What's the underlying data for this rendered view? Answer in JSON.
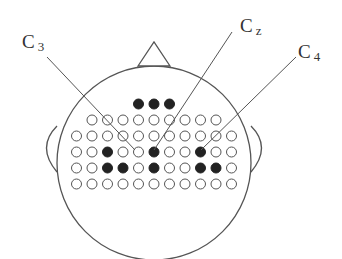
{
  "colors": {
    "stroke": "#555555",
    "filled": "#222222",
    "empty": "#ffffff",
    "text": "#333333"
  },
  "labels": [
    {
      "id": "C3",
      "letter": "C",
      "sub": "3",
      "x": 22,
      "y": 48,
      "line": [
        47,
        57,
        135,
        150
      ]
    },
    {
      "id": "Cz",
      "letter": "C",
      "sub": "z",
      "x": 240,
      "y": 32,
      "line": [
        232,
        32,
        154,
        150
      ]
    },
    {
      "id": "C4",
      "letter": "C",
      "sub": "4",
      "x": 298,
      "y": 58,
      "line": [
        296,
        57,
        201,
        150
      ]
    }
  ],
  "head": {
    "cx": 154,
    "cy": 163,
    "r": 97
  },
  "nose": {
    "points": "138,66 154,42 170,66"
  },
  "ears": {
    "left": "M 57 126 Q 36 147 57 172",
    "right": "M 251 126 Q 272 147 251 172"
  },
  "grid": {
    "dx": 15.5,
    "dot_r": 5,
    "rows": [
      {
        "y": 104,
        "x0": 138.5,
        "pattern": "111"
      },
      {
        "y": 120,
        "x0": 92,
        "pattern": "000000000"
      },
      {
        "y": 136,
        "x0": 76.5,
        "pattern": "00000000000"
      },
      {
        "y": 152,
        "x0": 76.5,
        "pattern": "00100100100"
      },
      {
        "y": 168,
        "x0": 76.5,
        "pattern": "00110100110"
      },
      {
        "y": 184,
        "x0": 76.5,
        "pattern": "00000000000"
      }
    ]
  }
}
